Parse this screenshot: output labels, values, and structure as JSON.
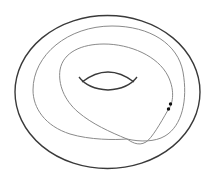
{
  "diagram": {
    "type": "torus-with-curve",
    "colors": {
      "background": "#ffffff",
      "torus_outline": "#3a3a3a",
      "hole_outline": "#3a3a3a",
      "curve": "#8a8a8a",
      "points": "#111111"
    },
    "elements": {
      "torus_outline": "outer ellipse of torus",
      "hole": "inner lens-shaped hole of torus",
      "curve": "closed curve winding twice around the torus with one self-intersection",
      "points": [
        "point-a",
        "point-b"
      ]
    }
  }
}
